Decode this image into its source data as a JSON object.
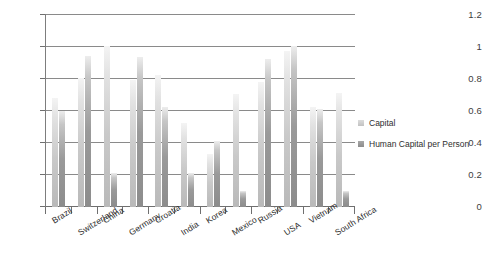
{
  "chart_data": {
    "type": "bar",
    "title": "",
    "subtitle": "",
    "xlabel": "",
    "ylabel": "",
    "ylim": [
      0,
      1.2
    ],
    "yticks": [
      "0",
      "0.2",
      "0.4",
      "0.6",
      "0.8",
      "1",
      "1.2"
    ],
    "ytick_values": [
      0,
      0.2,
      0.4,
      0.6,
      0.8,
      1,
      1.2
    ],
    "grid": true,
    "legend_position": "right",
    "categories": [
      "Brazil",
      "Switzerland",
      "China",
      "Germany",
      "Croatia",
      "India",
      "Korea",
      "Mexico",
      "Russia",
      "USA",
      "Vietnam",
      "South Africa"
    ],
    "series": [
      {
        "name": "Capital",
        "color": "#c9c9c9",
        "values": [
          0.68,
          0.8,
          1.0,
          0.79,
          0.82,
          0.52,
          0.33,
          0.7,
          0.78,
          0.97,
          0.62,
          0.71
        ]
      },
      {
        "name": "Human Capital per Person",
        "color": "#8c8c8c",
        "values": [
          0.6,
          0.94,
          0.21,
          0.93,
          0.62,
          0.21,
          0.41,
          0.1,
          0.92,
          1.0,
          0.61,
          0.1
        ]
      }
    ]
  },
  "legend": {
    "items": [
      {
        "label": "Capital",
        "swatch": "capital-swatch"
      },
      {
        "label": "Human Capital per Person",
        "swatch": "human-capital-swatch"
      }
    ]
  },
  "axis": {
    "y_tick_labels": [
      "1.2",
      "1",
      "0.8",
      "0.6",
      "0.4",
      "0.2",
      "0"
    ]
  }
}
